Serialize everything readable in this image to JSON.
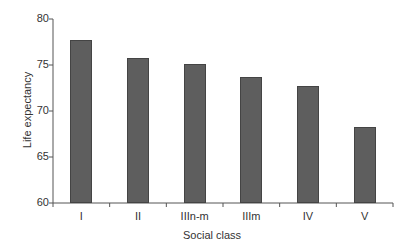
{
  "chart_data": {
    "type": "bar",
    "title": "",
    "xlabel": "Social class",
    "ylabel": "Life expectancy",
    "categories": [
      "I",
      "II",
      "IIIn-m",
      "IIIm",
      "IV",
      "V"
    ],
    "values": [
      77.7,
      75.8,
      75.1,
      73.7,
      72.7,
      68.3
    ],
    "ylim": [
      60,
      80
    ],
    "yticks": [
      60,
      65,
      70,
      75,
      80
    ],
    "grid": false,
    "legend": null,
    "bar_color": "#5e5e5e"
  }
}
